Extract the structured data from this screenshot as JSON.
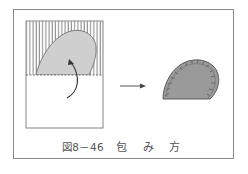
{
  "figure": {
    "caption_number": "図8－46",
    "caption_title": "包 み 方",
    "left_panel": {
      "description": "Dough sheet on paper, upper half shaded with vertical lines, filling shape placed, curved arrow showing fold",
      "hatch_color": "#555555",
      "filling_color": "#cfcfcf"
    },
    "arrow": "right-arrow",
    "right_panel": {
      "description": "Folded wrapped piece with pleated crimped edge",
      "fill_color": "#9a9a9a",
      "edge_color": "#5a5a5a"
    }
  }
}
